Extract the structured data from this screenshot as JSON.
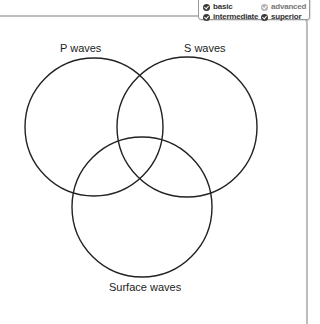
{
  "legend": {
    "items": [
      {
        "label": "basic",
        "icon": "check-circle-icon",
        "state": "dark"
      },
      {
        "label": "advanced",
        "icon": "check-circle-icon",
        "state": "light"
      },
      {
        "label": "intermediate",
        "icon": "check-circle-icon",
        "state": "dark"
      },
      {
        "label": "superior",
        "icon": "check-circle-icon",
        "state": "dark"
      }
    ]
  },
  "diagram": {
    "type": "venn",
    "sets": [
      {
        "label": "P waves",
        "cx": 94,
        "cy": 127,
        "r": 69
      },
      {
        "label": "S waves",
        "cx": 187,
        "cy": 127,
        "r": 70
      },
      {
        "label": "Surface waves",
        "cx": 142,
        "cy": 207,
        "r": 70
      }
    ],
    "stroke_color": "#222222",
    "frame_color": "#bdbdbd"
  }
}
